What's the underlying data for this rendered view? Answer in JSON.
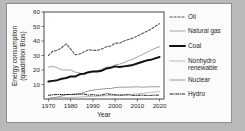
{
  "figure": {
    "background_color": "#b9b9b9",
    "panel_color": "#fbfbfb"
  },
  "chart_data": {
    "type": "line",
    "title": "",
    "xlabel": "Year",
    "ylabel": "Energy consumption (quadrillion Btus)",
    "ylabel_line1": "Energy consumption",
    "ylabel_line2": "(quadrillion Btus)",
    "xlim": [
      1968,
      2022
    ],
    "ylim": [
      0,
      60
    ],
    "xticks": [
      1970,
      1980,
      1990,
      2000,
      2010,
      2020
    ],
    "xtick_labels": [
      "1970",
      "1980",
      "1990",
      "2000",
      "2010",
      "2020"
    ],
    "yticks": [
      10,
      20,
      30,
      40,
      50,
      60
    ],
    "ytick_labels": [
      "10",
      "20",
      "30",
      "40",
      "50",
      "60"
    ],
    "grid": true,
    "legend_position": "right",
    "x": [
      1970,
      1972,
      1974,
      1976,
      1978,
      1980,
      1982,
      1984,
      1986,
      1988,
      1990,
      1992,
      1994,
      1996,
      1998,
      2000,
      2002,
      2004,
      2006,
      2008,
      2010,
      2012,
      2014,
      2016,
      2018,
      2020
    ],
    "series": [
      {
        "name": "Oil",
        "style": "dashed",
        "color": "#555555",
        "width": 1.1,
        "values": [
          30.0,
          33.0,
          33.5,
          35.5,
          38.0,
          34.5,
          30.5,
          31.0,
          32.5,
          34.0,
          33.5,
          33.5,
          34.5,
          36.0,
          36.5,
          38.5,
          38.5,
          40.0,
          41.0,
          42.0,
          43.5,
          45.0,
          46.5,
          48.0,
          50.0,
          52.0
        ]
      },
      {
        "name": "Natural gas",
        "style": "solid",
        "color": "#9a9a9a",
        "width": 0.9,
        "values": [
          22.0,
          22.5,
          21.5,
          20.0,
          20.0,
          20.0,
          18.5,
          18.0,
          16.5,
          18.0,
          19.0,
          19.5,
          20.5,
          22.0,
          22.0,
          23.5,
          24.0,
          25.0,
          26.5,
          27.5,
          29.0,
          30.5,
          32.0,
          33.5,
          35.0,
          36.0
        ]
      },
      {
        "name": "Coal",
        "style": "solid",
        "color": "#111111",
        "width": 2.0,
        "values": [
          12.0,
          12.5,
          13.0,
          14.0,
          14.5,
          15.5,
          15.5,
          17.0,
          17.5,
          18.5,
          19.0,
          19.0,
          19.5,
          21.0,
          21.5,
          22.5,
          22.0,
          22.5,
          23.0,
          23.5,
          24.5,
          25.5,
          26.5,
          27.0,
          28.0,
          29.0
        ]
      },
      {
        "name": "Nonhydro renewable",
        "style": "solid",
        "color": "#b0b0b0",
        "width": 0.9,
        "values": [
          0.6,
          0.7,
          0.8,
          0.9,
          1.0,
          1.1,
          1.2,
          1.4,
          1.5,
          1.7,
          1.9,
          2.0,
          2.2,
          2.3,
          2.4,
          2.5,
          2.7,
          2.9,
          3.1,
          3.3,
          3.6,
          3.9,
          4.2,
          4.5,
          4.8,
          5.1
        ]
      },
      {
        "name": "Nuclear",
        "style": "solid",
        "color": "#8c8c8c",
        "width": 0.9,
        "values": [
          0.3,
          0.8,
          1.3,
          2.0,
          3.0,
          3.0,
          3.2,
          3.6,
          4.5,
          5.6,
          6.1,
          6.5,
          6.8,
          7.2,
          7.2,
          7.9,
          8.1,
          8.2,
          8.2,
          8.3,
          8.4,
          8.2,
          8.3,
          8.4,
          8.4,
          8.5
        ]
      },
      {
        "name": "Hydro",
        "style": "dashdot",
        "color": "#222222",
        "width": 1.0,
        "values": [
          2.6,
          2.9,
          3.2,
          3.0,
          3.1,
          3.1,
          3.3,
          3.4,
          3.4,
          2.7,
          3.0,
          2.6,
          2.7,
          3.6,
          3.3,
          2.8,
          2.7,
          2.7,
          2.9,
          2.5,
          2.5,
          2.7,
          2.5,
          2.5,
          2.7,
          2.6
        ]
      }
    ]
  }
}
